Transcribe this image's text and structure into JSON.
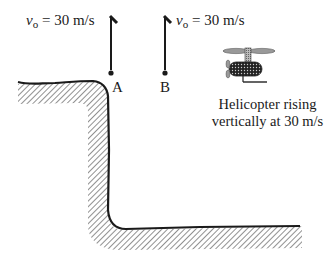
{
  "diagram": {
    "points": [
      {
        "id": "A",
        "label": "A",
        "velocity_symbol": "v",
        "velocity_subscript": "o",
        "velocity_text": " = 30 m/s"
      },
      {
        "id": "B",
        "label": "B",
        "velocity_symbol": "v",
        "velocity_subscript": "o",
        "velocity_text": " = 30 m/s"
      }
    ],
    "helicopter": {
      "caption_line1": "Helicopter rising",
      "caption_line2": "vertically at 30 m/s"
    },
    "colors": {
      "ink": "#1a1a1a",
      "hatch": "#555555",
      "background": "#ffffff"
    }
  }
}
